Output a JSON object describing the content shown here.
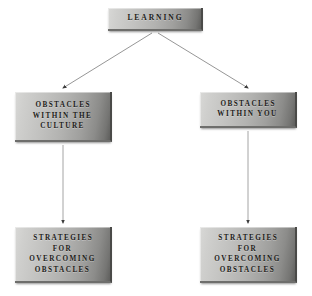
{
  "diagram": {
    "type": "flowchart",
    "background_color": "#ffffff",
    "node_fill_light": "#d8d8d6",
    "node_fill_dark": "#5e5e5c",
    "text_color": "#1d1c1a",
    "connector_color": "#8a8a8a",
    "nodes": [
      {
        "id": "learning",
        "label": "LEARNING",
        "level": "root"
      },
      {
        "id": "obstacles_culture",
        "label": "OBSTACLES\nWITHIN THE\nCULTURE",
        "level": "branch"
      },
      {
        "id": "obstacles_you",
        "label": "OBSTACLES\nWITHIN YOU",
        "level": "branch"
      },
      {
        "id": "strategies_culture",
        "label": "STRATEGIES\nFOR\nOVERCOMING\nOBSTACLES",
        "level": "leaf"
      },
      {
        "id": "strategies_you",
        "label": "STRATEGIES\nFOR\nOVERCOMING\nOBSTACLES",
        "level": "leaf"
      }
    ],
    "connectors": [
      {
        "id": "learning-to-culture",
        "from": "learning",
        "to": "obstacles_culture",
        "style": "diagonal-arrow"
      },
      {
        "id": "learning-to-you",
        "from": "learning",
        "to": "obstacles_you",
        "style": "diagonal-arrow"
      },
      {
        "id": "culture-to-strategies",
        "from": "obstacles_culture",
        "to": "strategies_culture",
        "style": "vertical-arrow"
      },
      {
        "id": "you-to-strategies",
        "from": "obstacles_you",
        "to": "strategies_you",
        "style": "vertical-arrow"
      }
    ]
  }
}
